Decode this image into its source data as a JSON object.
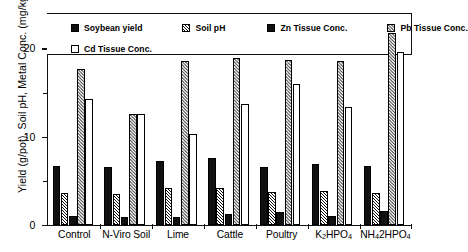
{
  "chart_data": {
    "type": "bar",
    "title": "",
    "xlabel": "",
    "ylabel": "Yield (g/pot), Soil pH, Metal Conc. (mg/kg)",
    "ylim": [
      0,
      24
    ],
    "yticks": [
      0,
      10,
      20
    ],
    "ytick_labels": [
      "0",
      "10",
      "20"
    ],
    "yminor_ticks": [
      5,
      15
    ],
    "grid": false,
    "legend_position": "top-inside",
    "categories": [
      "Control",
      "N-Viro Soil",
      "Lime",
      "Cattle",
      "Poultry",
      "K2HPO4",
      "NH42HPO4"
    ],
    "category_labels_html": [
      "Control",
      "N-Viro Soil",
      "Lime",
      "Cattle",
      "Poultry",
      "K<sub>2</sub>HPO<sub>4</sub>",
      "NH<sub>4</sub>2HPO<sub>4</sub>"
    ],
    "series": [
      {
        "name": "Soybean yield",
        "fill": "solid",
        "values": [
          6.7,
          6.6,
          7.2,
          7.6,
          6.6,
          6.9,
          6.7
        ]
      },
      {
        "name": "Soil pH",
        "fill": "dense",
        "values": [
          3.6,
          3.5,
          4.2,
          4.2,
          3.7,
          3.8,
          3.6
        ]
      },
      {
        "name": "Zn Tissue Conc.",
        "fill": "solid",
        "values": [
          1.0,
          0.9,
          0.9,
          1.3,
          1.5,
          1.0,
          1.6
        ]
      },
      {
        "name": "Pb Tissue Conc.",
        "fill": "hatch",
        "values": [
          17.7,
          12.6,
          18.6,
          18.9,
          18.7,
          18.6,
          21.7
        ]
      },
      {
        "name": "Cd Tissue Conc.",
        "fill": "open",
        "values": [
          14.3,
          12.6,
          10.3,
          13.7,
          16.0,
          13.4,
          19.6
        ]
      }
    ]
  },
  "legend": {
    "items": [
      {
        "label": "Soybean yield",
        "fill": "solid"
      },
      {
        "label": "Soil pH",
        "fill": "dense"
      },
      {
        "label": "Zn Tissue Conc.",
        "fill": "solid"
      },
      {
        "label": "Pb Tissue Conc.",
        "fill": "hatch"
      },
      {
        "label": "Cd Tissue Conc.",
        "fill": "open"
      }
    ]
  },
  "colors": {
    "axis": "#111111",
    "solid": "#101010",
    "hatch": "#5a5a5a",
    "background": "#ffffff"
  }
}
